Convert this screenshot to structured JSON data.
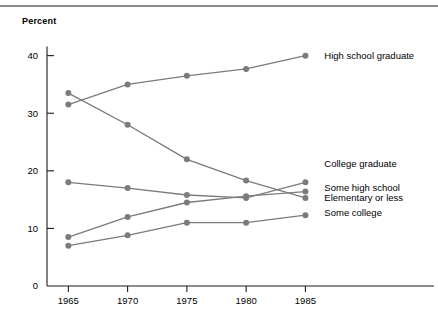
{
  "figure": {
    "axis_title": "Percent",
    "line_color": "#7b7b7b",
    "axis_color": "#1a1a1a",
    "rule_color": "#8c8c8c",
    "background": "#ffffff"
  },
  "chart_data": {
    "type": "line",
    "title": "",
    "subtitle": "",
    "xlabel": "",
    "ylabel": "Percent",
    "grid": false,
    "legend_position": "right-inline",
    "x": [
      1965,
      1970,
      1975,
      1980,
      1985
    ],
    "xtick_labels": [
      "1965",
      "1970",
      "1975",
      "1980",
      "1985"
    ],
    "ytick_labels": [
      "0",
      "10",
      "20",
      "30",
      "40"
    ],
    "yticks": [
      0,
      10,
      20,
      30,
      40
    ],
    "ylim": [
      0,
      41.5
    ],
    "xlim": [
      1963.2,
      1986.4
    ],
    "series": [
      {
        "name": "High school graduate",
        "values": [
          31.5,
          35.0,
          36.5,
          37.7,
          40.0
        ],
        "label_x": 1986.6,
        "label_y": 40.0
      },
      {
        "name": "Elementary or less",
        "values": [
          33.5,
          28.0,
          22.0,
          18.3,
          15.3
        ],
        "label_x": 1986.6,
        "label_y": 15.2
      },
      {
        "name": "Some high school",
        "values": [
          18.0,
          17.0,
          15.8,
          15.3,
          18.0
        ],
        "label_x": 1986.6,
        "label_y": 17.1
      },
      {
        "name": "College graduate",
        "values": [
          8.5,
          12.0,
          14.5,
          15.6,
          16.4
        ],
        "label_x": 1986.6,
        "label_y": 21.2
      },
      {
        "name": "Some college",
        "values": [
          7.0,
          8.8,
          11.0,
          11.0,
          12.3
        ],
        "label_x": 1986.6,
        "label_y": 12.6
      }
    ]
  }
}
